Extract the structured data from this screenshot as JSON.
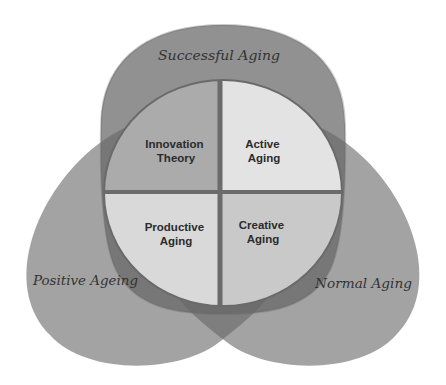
{
  "diagram": {
    "outer_sets": [
      {
        "id": "top",
        "label": "Successful Aging"
      },
      {
        "id": "left",
        "label": "Positive Ageing"
      },
      {
        "id": "right",
        "label": "Normal Aging"
      }
    ],
    "quadrants": [
      {
        "position": "top-left",
        "lines": [
          "Innovation",
          "Theory"
        ],
        "color": "#ababab"
      },
      {
        "position": "top-right",
        "lines": [
          "Active",
          "Aging"
        ],
        "color": "#e3e3e3"
      },
      {
        "position": "bottom-left",
        "lines": [
          "Productive",
          "Aging"
        ],
        "color": "#d9d9d9"
      },
      {
        "position": "bottom-right",
        "lines": [
          "Creative",
          "Aging"
        ],
        "color": "#c9c9c9"
      }
    ]
  },
  "colors": {
    "set_fill": "#666666",
    "divider": "#6b6b6b",
    "circle_outline": "#6a6a6a"
  }
}
